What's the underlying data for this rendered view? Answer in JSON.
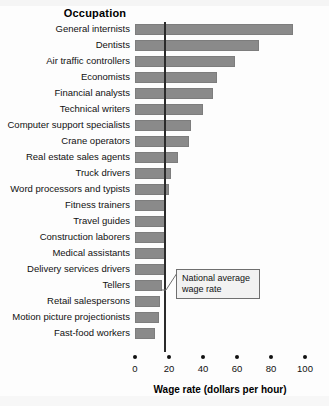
{
  "chart_data": {
    "type": "bar",
    "orientation": "horizontal",
    "title": "Occupation",
    "xlabel": "Wage rate (dollars per hour)",
    "ylabel": "Occupation",
    "xlim": [
      0,
      100
    ],
    "xticks": [
      0,
      20,
      40,
      60,
      80,
      100
    ],
    "grid": false,
    "legend": null,
    "bar_color": "#8a8a8a",
    "categories": [
      "General internists",
      "Dentists",
      "Air traffic controllers",
      "Economists",
      "Financial analysts",
      "Technical writers",
      "Computer support specialists",
      "Crane operators",
      "Real estate sales agents",
      "Truck drivers",
      "Word processors and typists",
      "Fitness trainers",
      "Travel guides",
      "Construction laborers",
      "Medical assistants",
      "Delivery services drivers",
      "Tellers",
      "Retail salespersons",
      "Motion picture projectionists",
      "Fast-food workers"
    ],
    "values": [
      93,
      73,
      59,
      48,
      46,
      40,
      33,
      32,
      25,
      21,
      20,
      18,
      17.5,
      17.5,
      17.5,
      17.5,
      16,
      14.5,
      14,
      12
    ],
    "annotations": [
      {
        "text": "National average wage rate",
        "line_1": "National average",
        "line_2": "wage rate",
        "value": 17,
        "type": "vertical-reference-line"
      }
    ]
  },
  "axis": {
    "tick_labels": [
      "0",
      "20",
      "40",
      "60",
      "80",
      "100"
    ],
    "x_axis_title": "Wage rate (dollars per hour)"
  },
  "header": {
    "title": "Occupation"
  },
  "annotation": {
    "line_1": "National average",
    "line_2": "wage rate"
  }
}
